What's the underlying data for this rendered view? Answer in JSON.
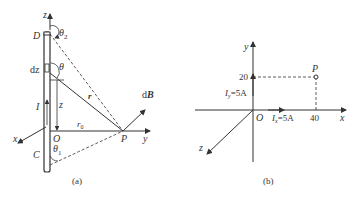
{
  "figure_a": {
    "caption": "(a)",
    "labels": {
      "z_axis": "z",
      "y_axis": "y",
      "x_axis": "x",
      "D": "D",
      "C": "C",
      "O": "O",
      "P": "P",
      "theta2": "θ",
      "theta2_sub": "2",
      "theta1": "θ",
      "theta1_sub": "1",
      "theta": "θ",
      "dz": "dz",
      "z": "z",
      "I": "I",
      "r": "r",
      "r0": "r",
      "r0_sub": "0",
      "dB_d": "d",
      "dB_B": "B"
    }
  },
  "figure_b": {
    "caption": "(b)",
    "labels": {
      "y_axis": "y",
      "x_axis": "x",
      "z_axis": "z",
      "O": "O",
      "P": "P",
      "y_tick": "20",
      "x_tick": "40",
      "Iy_I": "I",
      "Iy_sub": "y",
      "Iy_val": "=5A",
      "Ix_I": "I",
      "Ix_sub": "x",
      "Ix_val": "=5A"
    },
    "point_P": {
      "x": 40,
      "y": 20
    }
  },
  "colors": {
    "line": "#333333",
    "background": "#ffffff"
  }
}
